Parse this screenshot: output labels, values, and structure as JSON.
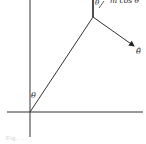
{
  "diagram": {
    "labels": {
      "theta_origin": "θ",
      "theta_top": "θ",
      "m_cos_theta": "m cos θ",
      "theta_hat": "θ̂"
    },
    "caption": "Fig. ..."
  }
}
